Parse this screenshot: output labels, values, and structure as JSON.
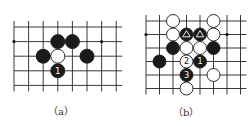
{
  "diagrams": [
    {
      "id": "a",
      "caption": "（a）",
      "grid": {
        "x0": 14,
        "y0": 27,
        "step": 14.6,
        "cols": 8,
        "rows": 5
      },
      "star_points": [
        [
          0,
          1
        ],
        [
          6,
          1
        ]
      ],
      "stones": [
        {
          "col": 3,
          "row": 1,
          "color": "black",
          "label": ""
        },
        {
          "col": 4,
          "row": 1,
          "color": "black",
          "label": ""
        },
        {
          "col": 2,
          "row": 2,
          "color": "black",
          "label": ""
        },
        {
          "col": 3,
          "row": 2,
          "color": "white",
          "label": ""
        },
        {
          "col": 5,
          "row": 2,
          "color": "black",
          "label": ""
        },
        {
          "col": 3,
          "row": 3,
          "color": "black",
          "label": "1"
        }
      ]
    },
    {
      "id": "b",
      "caption": "（b）",
      "grid": {
        "x0": 146,
        "y0": 21,
        "step": 13.5,
        "cols": 8,
        "rows": 6
      },
      "star_points": [
        [
          0,
          1
        ],
        [
          6,
          1
        ]
      ],
      "stones": [
        {
          "col": 2,
          "row": 0,
          "color": "white",
          "label": ""
        },
        {
          "col": 5,
          "row": 0,
          "color": "white",
          "label": ""
        },
        {
          "col": 2,
          "row": 1,
          "color": "white",
          "label": ""
        },
        {
          "col": 3,
          "row": 1,
          "color": "black",
          "label": "△"
        },
        {
          "col": 4,
          "row": 1,
          "color": "black",
          "label": "△"
        },
        {
          "col": 5,
          "row": 1,
          "color": "white",
          "label": ""
        },
        {
          "col": 2,
          "row": 2,
          "color": "black",
          "label": ""
        },
        {
          "col": 3,
          "row": 2,
          "color": "white",
          "label": ""
        },
        {
          "col": 4,
          "row": 2,
          "color": "white",
          "label": ""
        },
        {
          "col": 5,
          "row": 2,
          "color": "black",
          "label": ""
        },
        {
          "col": 1,
          "row": 3,
          "color": "black",
          "label": ""
        },
        {
          "col": 3,
          "row": 3,
          "color": "white",
          "label": "2"
        },
        {
          "col": 4,
          "row": 3,
          "color": "black",
          "label": "1"
        },
        {
          "col": 3,
          "row": 4,
          "color": "black",
          "label": "3"
        },
        {
          "col": 5,
          "row": 4,
          "color": "white",
          "label": ""
        },
        {
          "col": 3,
          "row": 5,
          "color": "white",
          "label": ""
        }
      ]
    }
  ]
}
